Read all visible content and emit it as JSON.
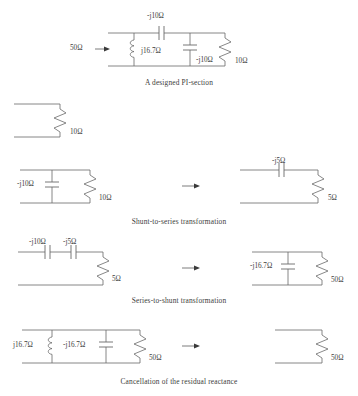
{
  "figure": {
    "title_present": false,
    "rows": [
      {
        "id": "pi-section",
        "caption": "A designed PI-section",
        "labels": {
          "source": "50Ω",
          "series_cap": "-j10Ω",
          "shunt_ind": "j16.7Ω",
          "shunt_cap": "-j10Ω",
          "load": "10Ω"
        }
      },
      {
        "id": "load-only",
        "caption": "",
        "labels": {
          "load": "10Ω"
        }
      },
      {
        "id": "shunt-to-series",
        "caption": "Shunt-to-series transformation",
        "labels": {
          "left_shunt_cap": "-j10Ω",
          "left_load": "10Ω",
          "right_series_cap": "-j5Ω",
          "right_load": "5Ω"
        }
      },
      {
        "id": "series-to-shunt",
        "caption": "Series-to-shunt transformation",
        "labels": {
          "left_cap_1": "-j10Ω",
          "left_cap_2": "-j5Ω",
          "left_load": "5Ω",
          "right_shunt_cap": "-j16.7Ω",
          "right_load": "50Ω"
        }
      },
      {
        "id": "cancellation",
        "caption": "Cancellation of the residual reactance",
        "labels": {
          "left_shunt_ind": "j16.7Ω",
          "left_shunt_cap": "-j16.7Ω",
          "left_load": "50Ω",
          "right_load": "50Ω"
        }
      }
    ],
    "colors": {
      "wire": "#676767",
      "text": "#3c3c3c",
      "background": "#ffffff"
    }
  }
}
